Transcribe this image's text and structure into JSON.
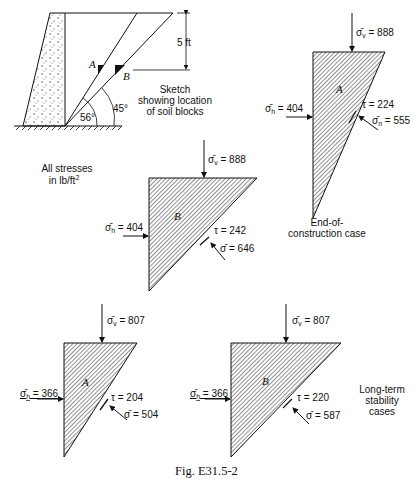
{
  "figure": {
    "caption": "Fig. E31.5-2",
    "units_note_line1": "All stresses",
    "units_note_line2": "in lb/ft",
    "units_note_sup": "2"
  },
  "sketch": {
    "dimension_label": "5 ft",
    "block_a_label": "A",
    "block_b_label": "B",
    "angle_a": "56°",
    "angle_b": "45°",
    "note_line1": "Sketch",
    "note_line2": "showing location",
    "note_line3": "of soil blocks"
  },
  "cases": {
    "end_of_construction": {
      "label_line1": "End-of-",
      "label_line2": "construction case",
      "block_a": {
        "name": "A",
        "sigma_v": "888",
        "sigma_h": "404",
        "tau": "224",
        "sigma_n": "555"
      },
      "block_b": {
        "name": "B",
        "sigma_v": "888",
        "sigma_h": "404",
        "tau": "242",
        "sigma_n": "646"
      }
    },
    "long_term": {
      "label_line1": "Long-term",
      "label_line2": "stability",
      "label_line3": "cases",
      "block_a": {
        "name": "A",
        "sigma_v": "807",
        "sigma_h": "366",
        "tau": "204",
        "sigma_n": "504"
      },
      "block_b": {
        "name": "B",
        "sigma_v": "807",
        "sigma_h": "366",
        "tau": "220",
        "sigma_n": "587"
      }
    }
  },
  "symbols": {
    "sigma_v_prefix": "σ̄",
    "sigma_v_sub": "v",
    "sigma_h_sub": "h",
    "sigma_n_sub": "n",
    "tau": "τ",
    "eq": " = "
  }
}
